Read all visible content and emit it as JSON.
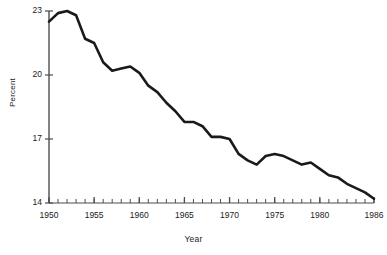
{
  "chart_data": {
    "type": "line",
    "title": "",
    "subtitle": "",
    "xlabel": "Year",
    "ylabel": "Percent",
    "grid": false,
    "legend": "none",
    "xlim": [
      1950,
      1986
    ],
    "ylim": [
      14,
      23
    ],
    "yticks": [
      14,
      17,
      20,
      23
    ],
    "ytick_labels": [
      "14",
      "17",
      "20",
      "23"
    ],
    "xticks": [
      1950,
      1955,
      1960,
      1965,
      1970,
      1975,
      1980,
      1986
    ],
    "xtick_labels": [
      "1950",
      "1955",
      "1960",
      "1965",
      "1970",
      "1975",
      "1980",
      "1986"
    ],
    "minor_xtick_interval": 1,
    "line_color": "#1a1a1a",
    "line_width": 2.6,
    "x": [
      1950,
      1951,
      1952,
      1953,
      1954,
      1955,
      1956,
      1957,
      1958,
      1959,
      1960,
      1961,
      1962,
      1963,
      1964,
      1965,
      1966,
      1967,
      1968,
      1969,
      1970,
      1971,
      1972,
      1973,
      1974,
      1975,
      1976,
      1977,
      1978,
      1979,
      1980,
      1981,
      1982,
      1983,
      1984,
      1985,
      1986
    ],
    "values": [
      22.5,
      22.9,
      23.0,
      22.8,
      21.7,
      21.5,
      20.6,
      20.2,
      20.3,
      20.4,
      20.1,
      19.5,
      19.2,
      18.7,
      18.3,
      17.8,
      17.8,
      17.6,
      17.1,
      17.1,
      17.0,
      16.3,
      16.0,
      15.8,
      16.2,
      16.3,
      16.2,
      16.0,
      15.8,
      15.9,
      15.6,
      15.3,
      15.2,
      14.9,
      14.7,
      14.5,
      14.2
    ],
    "series": [
      {
        "name": "Percent",
        "values": [
          22.5,
          22.9,
          23.0,
          22.8,
          21.7,
          21.5,
          20.6,
          20.2,
          20.3,
          20.4,
          20.1,
          19.5,
          19.2,
          18.7,
          18.3,
          17.8,
          17.8,
          17.6,
          17.1,
          17.1,
          17.0,
          16.3,
          16.0,
          15.8,
          16.2,
          16.3,
          16.2,
          16.0,
          15.8,
          15.9,
          15.6,
          15.3,
          15.2,
          14.9,
          14.7,
          14.5,
          14.2
        ]
      }
    ]
  }
}
